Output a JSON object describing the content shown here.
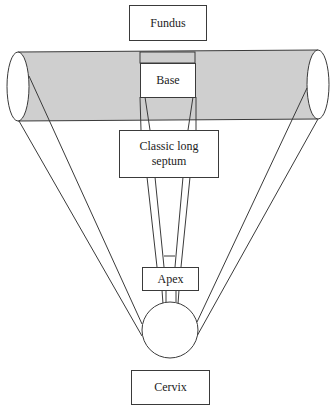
{
  "diagram": {
    "type": "anatomical schematic",
    "colors": {
      "line": "#3a3a3a",
      "band_fill": "#cfcfcf",
      "background": "#ffffff"
    },
    "labels": {
      "fundus": "Fundus",
      "base": "Base",
      "septum": "Classic long septum",
      "septum_line1": "Classic long",
      "septum_line2": "septum",
      "apex": "Apex",
      "cervix": "Cervix"
    },
    "order_top_to_bottom": [
      "Fundus",
      "Base",
      "Classic long septum",
      "Apex",
      "Cervix"
    ]
  }
}
